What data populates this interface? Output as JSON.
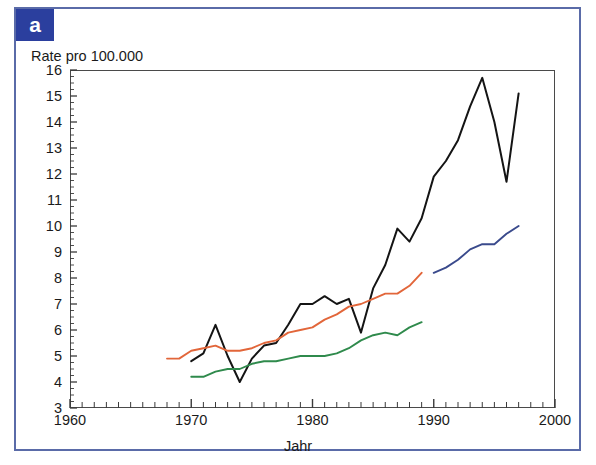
{
  "panel": {
    "badge_label": "a",
    "badge_color": "#2b3f9e",
    "frame_color": "#5a6ba8"
  },
  "chart_data": {
    "type": "line",
    "title": "",
    "subtitle": "",
    "xlabel": "Jahr",
    "ylabel": "Rate pro 100.000",
    "xlim": [
      1960,
      2000
    ],
    "ylim": [
      3,
      16
    ],
    "xticks": [
      1960,
      1970,
      1980,
      1990,
      2000
    ],
    "xtick_labels": [
      "1960",
      "1970",
      "1980",
      "1990",
      "2000"
    ],
    "xminor_tick_step": 1,
    "yticks": [
      3,
      4,
      5,
      6,
      7,
      8,
      9,
      10,
      11,
      12,
      13,
      14,
      15,
      16
    ],
    "ytick_labels": [
      "3",
      "4",
      "5",
      "6",
      "7",
      "8",
      "9",
      "10",
      "11",
      "12",
      "13",
      "14",
      "15",
      "16"
    ],
    "yminor_tick_step": 0.25,
    "grid": false,
    "legend": "none",
    "legend_position": "none",
    "series": [
      {
        "name": "black-series",
        "color": "#141414",
        "x": [
          1970,
          1971,
          1972,
          1973,
          1974,
          1975,
          1976,
          1977,
          1978,
          1979,
          1980,
          1981,
          1982,
          1983,
          1984,
          1985,
          1986,
          1987,
          1988,
          1989,
          1990,
          1991,
          1992,
          1993,
          1994,
          1995,
          1996,
          1997
        ],
        "values": [
          4.8,
          5.1,
          6.2,
          5.0,
          4.0,
          4.9,
          5.4,
          5.5,
          6.2,
          7.0,
          7.0,
          7.3,
          7.0,
          7.2,
          5.9,
          7.6,
          8.5,
          9.9,
          9.4,
          10.3,
          11.9,
          12.5,
          13.3,
          14.6,
          15.7,
          14.0,
          11.7,
          15.1
        ]
      },
      {
        "name": "orange-series",
        "color": "#e2663a",
        "x": [
          1968,
          1969,
          1970,
          1971,
          1972,
          1973,
          1974,
          1975,
          1976,
          1977,
          1978,
          1979,
          1980,
          1981,
          1982,
          1983,
          1984,
          1985,
          1986,
          1987,
          1988,
          1989
        ],
        "values": [
          4.9,
          4.9,
          5.2,
          5.3,
          5.4,
          5.2,
          5.2,
          5.3,
          5.5,
          5.6,
          5.9,
          6.0,
          6.1,
          6.4,
          6.6,
          6.9,
          7.0,
          7.2,
          7.4,
          7.4,
          7.7,
          8.2
        ]
      },
      {
        "name": "green-series",
        "color": "#2f8a4c",
        "x": [
          1970,
          1971,
          1972,
          1973,
          1974,
          1975,
          1976,
          1977,
          1978,
          1979,
          1980,
          1981,
          1982,
          1983,
          1984,
          1985,
          1986,
          1987,
          1988,
          1989
        ],
        "values": [
          4.2,
          4.2,
          4.4,
          4.5,
          4.5,
          4.7,
          4.8,
          4.8,
          4.9,
          5.0,
          5.0,
          5.0,
          5.1,
          5.3,
          5.6,
          5.8,
          5.9,
          5.8,
          6.1,
          6.3
        ]
      },
      {
        "name": "blue-series",
        "color": "#3a4a8c",
        "x": [
          1990,
          1991,
          1992,
          1993,
          1994,
          1995,
          1996,
          1997
        ],
        "values": [
          8.2,
          8.4,
          8.7,
          9.1,
          9.3,
          9.3,
          9.7,
          10.0
        ]
      }
    ]
  }
}
